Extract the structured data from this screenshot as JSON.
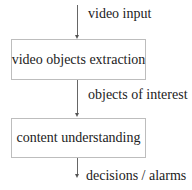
{
  "diagram": {
    "type": "flowchart",
    "nodes": [
      {
        "id": "extraction",
        "label": "video objects extraction"
      },
      {
        "id": "understanding",
        "label": "content understanding"
      }
    ],
    "edges": [
      {
        "from": null,
        "to": "extraction",
        "label": "video input"
      },
      {
        "from": "extraction",
        "to": "understanding",
        "label": "objects of interest"
      },
      {
        "from": "understanding",
        "to": null,
        "label": "decisions / alarms"
      }
    ]
  }
}
